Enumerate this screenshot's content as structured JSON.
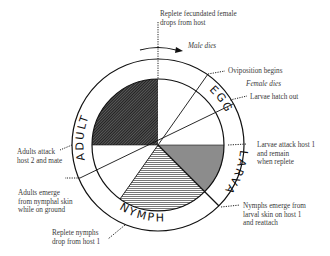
{
  "diagram": {
    "colors": {
      "line": "#111111",
      "adult_fill": "#3a3a3a",
      "larva_fill": "#8a8a8a",
      "nymph_fill": "#9a9a9a"
    },
    "stages": [
      {
        "name": "ADULT"
      },
      {
        "name": "EGG"
      },
      {
        "name": "LARVA"
      },
      {
        "name": "NYMPH"
      }
    ],
    "annotations": {
      "replete_female": [
        "Replete fecundated female",
        "drops from host"
      ],
      "male_dies": "Male dies",
      "oviposition": "Oviposition begins",
      "female_dies": "Female dies",
      "larvae_hatch": "Larvae hatch out",
      "larvae_attack": [
        "Larvae attack host 1",
        "and remain",
        "when replete"
      ],
      "nymphs_emerge": [
        "Nymphs emerge from",
        "larval skin on host 1",
        "and reattach"
      ],
      "replete_nymphs": [
        "Replete nymphs",
        "drop from host 1"
      ],
      "adults_emerge": [
        "Adults emerge",
        "from nymphal skin",
        "while on ground"
      ],
      "adults_attack": [
        "Adults attack",
        "host 2 and mate"
      ]
    }
  }
}
